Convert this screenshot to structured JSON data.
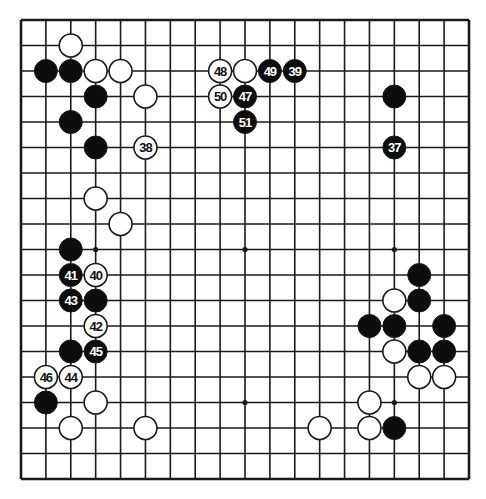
{
  "diagram": {
    "type": "go-board",
    "size": 19,
    "colors": {
      "background": "#ffffff",
      "line": "#1a1a1a",
      "black_stone": "#0d0d0d",
      "white_stone": "#ffffff",
      "stone_outline": "#1a1a1a"
    },
    "hoshi_visible": [
      [
        4,
        10
      ],
      [
        10,
        10
      ],
      [
        16,
        10
      ],
      [
        10,
        16
      ],
      [
        16,
        16
      ]
    ],
    "stones": [
      {
        "col": 3,
        "row": 2,
        "color": "white",
        "label": ""
      },
      {
        "col": 2,
        "row": 3,
        "color": "black",
        "label": ""
      },
      {
        "col": 3,
        "row": 3,
        "color": "black",
        "label": ""
      },
      {
        "col": 4,
        "row": 3,
        "color": "white",
        "label": ""
      },
      {
        "col": 5,
        "row": 3,
        "color": "white",
        "label": ""
      },
      {
        "col": 4,
        "row": 4,
        "color": "black",
        "label": ""
      },
      {
        "col": 6,
        "row": 4,
        "color": "white",
        "label": ""
      },
      {
        "col": 3,
        "row": 5,
        "color": "black",
        "label": ""
      },
      {
        "col": 4,
        "row": 6,
        "color": "black",
        "label": ""
      },
      {
        "col": 6,
        "row": 6,
        "color": "white",
        "label": "38"
      },
      {
        "col": 4,
        "row": 8,
        "color": "white",
        "label": ""
      },
      {
        "col": 5,
        "row": 9,
        "color": "white",
        "label": ""
      },
      {
        "col": 9,
        "row": 3,
        "color": "white",
        "label": "48"
      },
      {
        "col": 10,
        "row": 3,
        "color": "white",
        "label": ""
      },
      {
        "col": 11,
        "row": 3,
        "color": "black",
        "label": "49"
      },
      {
        "col": 12,
        "row": 3,
        "color": "black",
        "label": "39"
      },
      {
        "col": 9,
        "row": 4,
        "color": "white",
        "label": "50"
      },
      {
        "col": 10,
        "row": 4,
        "color": "black",
        "label": "47"
      },
      {
        "col": 10,
        "row": 5,
        "color": "black",
        "label": "51"
      },
      {
        "col": 16,
        "row": 4,
        "color": "black",
        "label": ""
      },
      {
        "col": 16,
        "row": 6,
        "color": "black",
        "label": "37"
      },
      {
        "col": 3,
        "row": 10,
        "color": "black",
        "label": ""
      },
      {
        "col": 3,
        "row": 11,
        "color": "black",
        "label": "41"
      },
      {
        "col": 4,
        "row": 11,
        "color": "white",
        "label": "40"
      },
      {
        "col": 3,
        "row": 12,
        "color": "black",
        "label": "43"
      },
      {
        "col": 4,
        "row": 12,
        "color": "black",
        "label": ""
      },
      {
        "col": 4,
        "row": 13,
        "color": "white",
        "label": "42"
      },
      {
        "col": 3,
        "row": 14,
        "color": "black",
        "label": ""
      },
      {
        "col": 4,
        "row": 14,
        "color": "black",
        "label": "45"
      },
      {
        "col": 2,
        "row": 15,
        "color": "white",
        "label": "46"
      },
      {
        "col": 3,
        "row": 15,
        "color": "white",
        "label": "44"
      },
      {
        "col": 2,
        "row": 16,
        "color": "black",
        "label": ""
      },
      {
        "col": 4,
        "row": 16,
        "color": "white",
        "label": ""
      },
      {
        "col": 3,
        "row": 17,
        "color": "white",
        "label": ""
      },
      {
        "col": 6,
        "row": 17,
        "color": "white",
        "label": ""
      },
      {
        "col": 13,
        "row": 17,
        "color": "white",
        "label": ""
      },
      {
        "col": 17,
        "row": 11,
        "color": "black",
        "label": ""
      },
      {
        "col": 16,
        "row": 12,
        "color": "white",
        "label": ""
      },
      {
        "col": 17,
        "row": 12,
        "color": "black",
        "label": ""
      },
      {
        "col": 15,
        "row": 13,
        "color": "black",
        "label": ""
      },
      {
        "col": 16,
        "row": 13,
        "color": "black",
        "label": ""
      },
      {
        "col": 18,
        "row": 13,
        "color": "black",
        "label": ""
      },
      {
        "col": 16,
        "row": 14,
        "color": "white",
        "label": ""
      },
      {
        "col": 17,
        "row": 14,
        "color": "black",
        "label": ""
      },
      {
        "col": 18,
        "row": 14,
        "color": "black",
        "label": ""
      },
      {
        "col": 17,
        "row": 15,
        "color": "white",
        "label": ""
      },
      {
        "col": 18,
        "row": 15,
        "color": "white",
        "label": ""
      },
      {
        "col": 15,
        "row": 16,
        "color": "white",
        "label": ""
      },
      {
        "col": 15,
        "row": 17,
        "color": "white",
        "label": ""
      },
      {
        "col": 16,
        "row": 17,
        "color": "black",
        "label": ""
      }
    ]
  }
}
